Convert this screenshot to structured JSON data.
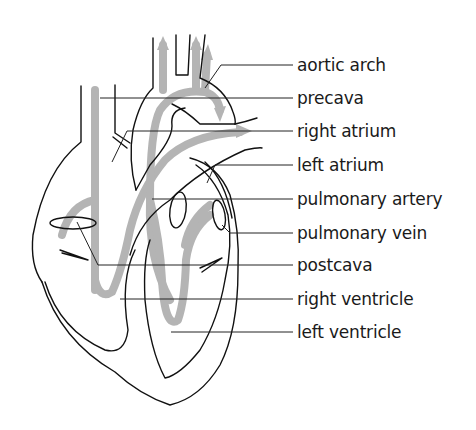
{
  "diagram": {
    "colors": {
      "outline": "#111111",
      "flow": "#b4b4b4",
      "background": "#ffffff",
      "text": "#1a1a1a"
    },
    "labels": [
      {
        "id": "aortic-arch",
        "text": "aortic arch",
        "y": 65
      },
      {
        "id": "precava",
        "text": "precava",
        "y": 98
      },
      {
        "id": "right-atrium",
        "text": "right atrium",
        "y": 131
      },
      {
        "id": "left-atrium",
        "text": "left atrium",
        "y": 165
      },
      {
        "id": "pulmonary-artery",
        "text": "pulmonary artery",
        "y": 199
      },
      {
        "id": "pulmonary-vein",
        "text": "pulmonary vein",
        "y": 233
      },
      {
        "id": "postcava",
        "text": "postcava",
        "y": 265
      },
      {
        "id": "right-ventricle",
        "text": "right ventricle",
        "y": 299
      },
      {
        "id": "left-ventricle",
        "text": "left ventricle",
        "y": 332
      }
    ]
  }
}
